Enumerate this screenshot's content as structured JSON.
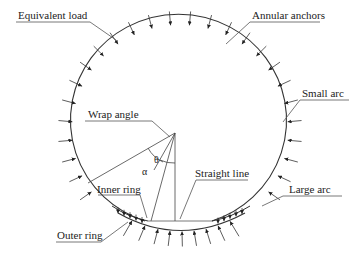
{
  "labels": {
    "equivalent_load": "Equivalent load",
    "annular_anchors": "Annular anchors",
    "small_arc": "Small arc",
    "wrap_angle": "Wrap angle",
    "straight_line": "Straight line",
    "large_arc": "Large arc",
    "inner_ring": "Inner ring",
    "outer_ring": "Outer ring",
    "theta": "θ",
    "alpha": "α"
  },
  "colors": {
    "line": "#333333",
    "background": "#ffffff"
  }
}
